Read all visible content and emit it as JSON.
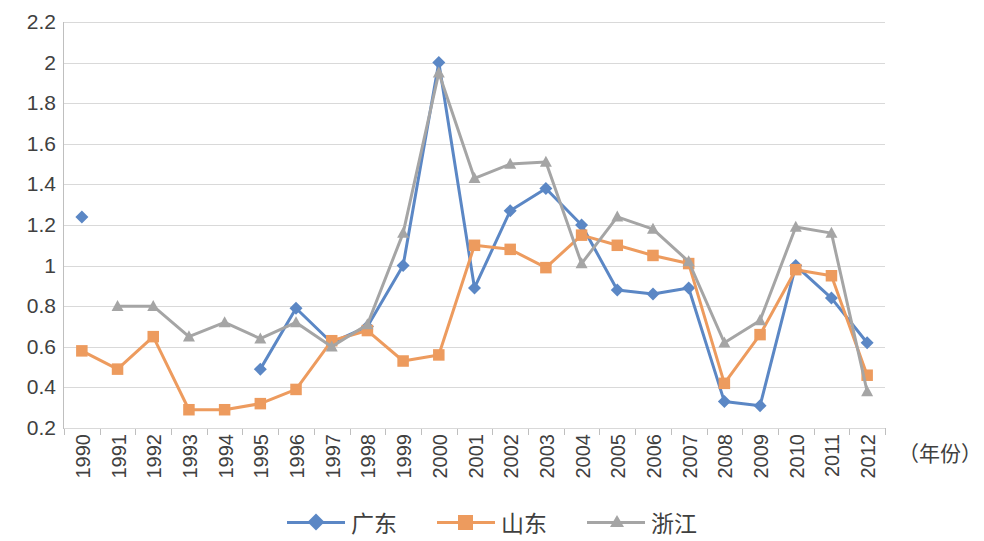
{
  "chart_data": {
    "type": "line",
    "title": "",
    "xlabel": "（年份）",
    "ylabel": "",
    "xlim": [
      1990,
      2012
    ],
    "ylim": [
      0.2,
      2.2
    ],
    "ytick_step": 0.2,
    "grid": true,
    "legend_position": "bottom",
    "categories": [
      "1990",
      "1991",
      "1992",
      "1993",
      "1994",
      "1995",
      "1996",
      "1997",
      "1998",
      "1999",
      "2000",
      "2001",
      "2002",
      "2003",
      "2004",
      "2005",
      "2006",
      "2007",
      "2008",
      "2009",
      "2010",
      "2011",
      "2012"
    ],
    "ytick_labels": [
      "2.2",
      "2",
      "1.8",
      "1.6",
      "1.4",
      "1.2",
      "1",
      "0.8",
      "0.6",
      "0.4",
      "0.2"
    ],
    "ytick_values": [
      2.2,
      2.0,
      1.8,
      1.6,
      1.4,
      1.2,
      1.0,
      0.8,
      0.6,
      0.4,
      0.2
    ],
    "series": [
      {
        "name": "广东",
        "color": "#5B87C5",
        "marker": "diamond",
        "values": [
          1.24,
          null,
          null,
          null,
          null,
          0.49,
          0.79,
          0.62,
          0.7,
          1.0,
          2.0,
          0.89,
          1.27,
          1.38,
          1.2,
          0.88,
          0.86,
          0.89,
          0.33,
          0.31,
          1.0,
          0.84,
          0.62
        ]
      },
      {
        "name": "山东",
        "color": "#ED9B5E",
        "marker": "square",
        "values": [
          0.58,
          0.49,
          0.65,
          0.29,
          0.29,
          0.32,
          0.39,
          0.63,
          0.68,
          0.53,
          0.56,
          1.1,
          1.08,
          0.99,
          1.15,
          1.1,
          1.05,
          1.01,
          0.42,
          0.66,
          0.98,
          0.95,
          0.46
        ]
      },
      {
        "name": "浙江",
        "color": "#A5A5A5",
        "marker": "triangle",
        "values": [
          null,
          0.8,
          0.8,
          0.65,
          0.72,
          0.64,
          0.72,
          0.6,
          0.71,
          1.16,
          1.95,
          1.43,
          1.5,
          1.51,
          1.01,
          1.24,
          1.18,
          1.02,
          0.62,
          0.73,
          1.19,
          1.16,
          0.38
        ]
      }
    ]
  },
  "legend": {
    "items": [
      {
        "label": "广东",
        "color": "#5B87C5",
        "marker": "diamond"
      },
      {
        "label": "山东",
        "color": "#ED9B5E",
        "marker": "square"
      },
      {
        "label": "浙江",
        "color": "#A5A5A5",
        "marker": "triangle"
      }
    ]
  },
  "axis": {
    "x_title": "（年份）"
  }
}
